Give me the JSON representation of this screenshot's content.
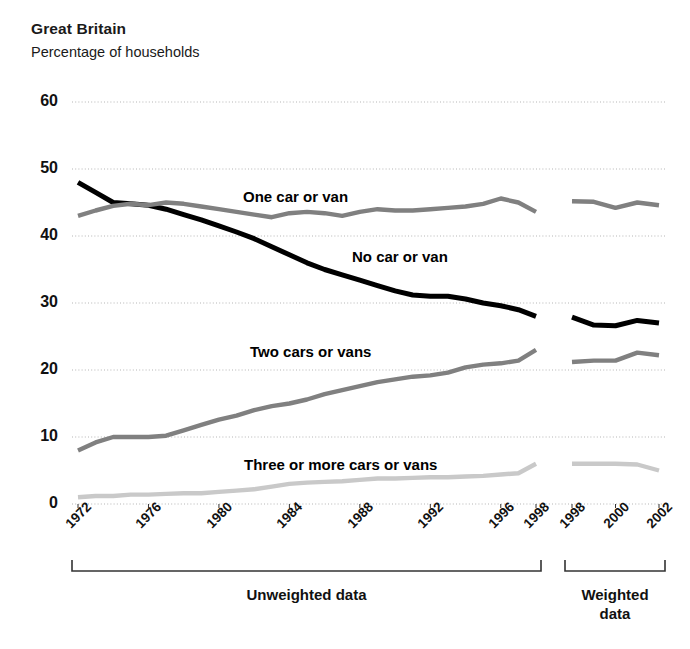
{
  "header": {
    "title": "Great Britain",
    "subtitle": "Percentage of households"
  },
  "axis_brackets": [
    {
      "label": "Unweighted data",
      "x_start": 72,
      "x_end": 541
    },
    {
      "label": "Weighted\ndata",
      "x_start": 565,
      "x_end": 665
    }
  ],
  "colors": {
    "no_car": "#000000",
    "one_car": "#808080",
    "two_cars": "#808080",
    "three_cars": "#c9c9c9",
    "gridline": "#b5b5b5",
    "axis": "#333333",
    "text": "#1a1a1a"
  },
  "chart_data": {
    "type": "line",
    "title": "Great Britain",
    "subtitle": "Percentage of households",
    "xlabel": "",
    "ylabel": "Percentage of households",
    "ylim": [
      0,
      60
    ],
    "yticks": [
      0,
      10,
      20,
      30,
      40,
      50,
      60
    ],
    "xticks": [
      "1972",
      "1976",
      "1980",
      "1984",
      "1988",
      "1992",
      "1996",
      "1998",
      "1998",
      "2000",
      "2002"
    ],
    "grid": true,
    "legend": "inline-labels",
    "x_unweighted": [
      1972,
      1973,
      1974,
      1975,
      1976,
      1977,
      1978,
      1979,
      1980,
      1981,
      1982,
      1983,
      1984,
      1985,
      1986,
      1987,
      1988,
      1989,
      1990,
      1991,
      1992,
      1993,
      1994,
      1995,
      1996,
      1997,
      1998
    ],
    "x_weighted": [
      1998,
      1999,
      2000,
      2001,
      2002
    ],
    "series": [
      {
        "name": "No car or van",
        "color": "#000000",
        "values_unweighted": [
          48.0,
          46.5,
          45.0,
          44.8,
          44.6,
          44.0,
          43.2,
          42.4,
          41.5,
          40.6,
          39.6,
          38.4,
          37.2,
          36.0,
          35.0,
          34.2,
          33.4,
          32.6,
          31.8,
          31.2,
          31.0,
          31.0,
          30.6,
          30.0,
          29.6,
          29.0,
          28.0
        ],
        "values_weighted": [
          27.9,
          26.7,
          26.6,
          27.4,
          27.0
        ]
      },
      {
        "name": "One car or van",
        "color": "#808080",
        "values_unweighted": [
          43.0,
          43.8,
          44.5,
          44.8,
          44.6,
          45.0,
          44.8,
          44.4,
          44.0,
          43.6,
          43.2,
          42.8,
          43.4,
          43.6,
          43.4,
          43.0,
          43.6,
          44.0,
          43.8,
          43.8,
          44.0,
          44.2,
          44.4,
          44.8,
          45.6,
          45.0,
          43.6
        ],
        "values_weighted": [
          45.2,
          45.1,
          44.2,
          45.0,
          44.6
        ]
      },
      {
        "name": "Two cars or vans",
        "color": "#808080",
        "values_unweighted": [
          8.0,
          9.2,
          10.0,
          10.0,
          10.0,
          10.2,
          11.0,
          11.8,
          12.6,
          13.2,
          14.0,
          14.6,
          15.0,
          15.6,
          16.4,
          17.0,
          17.6,
          18.2,
          18.6,
          19.0,
          19.2,
          19.6,
          20.4,
          20.8,
          21.0,
          21.4,
          23.0
        ],
        "values_weighted": [
          21.2,
          21.4,
          21.4,
          22.6,
          22.2
        ]
      },
      {
        "name": "Three or more cars or vans",
        "color": "#c9c9c9",
        "values_unweighted": [
          1.0,
          1.2,
          1.2,
          1.4,
          1.4,
          1.5,
          1.6,
          1.6,
          1.8,
          2.0,
          2.2,
          2.6,
          3.0,
          3.2,
          3.3,
          3.4,
          3.6,
          3.8,
          3.8,
          3.9,
          4.0,
          4.0,
          4.1,
          4.2,
          4.4,
          4.6,
          6.0
        ],
        "values_weighted": [
          6.0,
          6.0,
          6.0,
          5.9,
          5.0
        ]
      }
    ],
    "annotations": [
      {
        "text": "One car or van",
        "x_px": 243,
        "y_px": 188
      },
      {
        "text": "No car or van",
        "x_px": 352,
        "y_px": 248
      },
      {
        "text": "Two cars or vans",
        "x_px": 250,
        "y_px": 343
      },
      {
        "text": "Three or more cars or vans",
        "x_px": 244,
        "y_px": 456
      }
    ]
  }
}
